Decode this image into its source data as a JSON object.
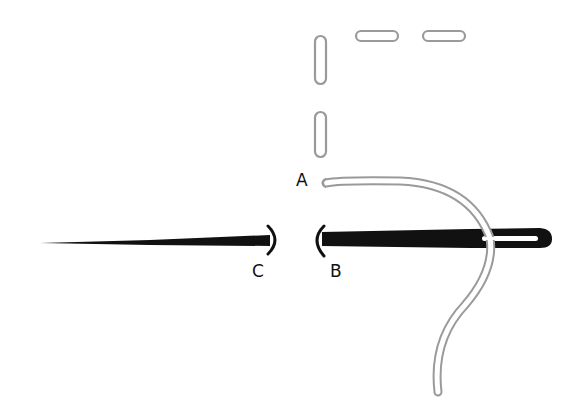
{
  "diagram": {
    "labels": {
      "a": "A",
      "b": "B",
      "c": "C"
    },
    "colors": {
      "background": "#ffffff",
      "needle": "#111111",
      "thread_outline": "#9a9a9a",
      "thread_fill": "#ffffff",
      "label": "#111111"
    },
    "elements": {
      "completed_stitches": 4,
      "needle": "needle with eye on right, point on left, split at fabric",
      "thread": "thread passes through needle eye and trails downward"
    }
  }
}
